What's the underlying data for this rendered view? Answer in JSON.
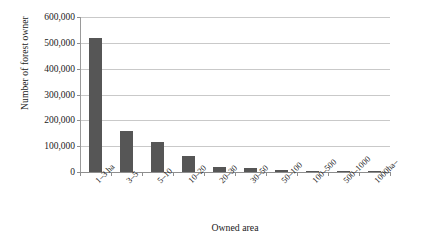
{
  "chart_data": {
    "type": "bar",
    "title": "",
    "xlabel": "Owned area",
    "ylabel": "Number of forest owner",
    "categories": [
      "1–3 ha",
      "3–5",
      "5–10",
      "10–20",
      "20–30",
      "30–50",
      "50–100",
      "100–500",
      "500–1000",
      "1000ha–"
    ],
    "values": [
      517000,
      160000,
      118000,
      62000,
      21000,
      15000,
      6000,
      3000,
      900,
      400
    ],
    "ylim": [
      0,
      600000
    ],
    "yticks": [
      0,
      100000,
      200000,
      300000,
      400000,
      500000,
      600000
    ],
    "ytick_labels": [
      "0",
      "100,000",
      "200,000",
      "300,000",
      "400,000",
      "500,000",
      "600,000"
    ],
    "grid": true,
    "legend": false,
    "bar_color": "#565656",
    "grid_color": "#c9c9c9",
    "axis_color": "#8e8e8e",
    "background": "#ffffff"
  }
}
